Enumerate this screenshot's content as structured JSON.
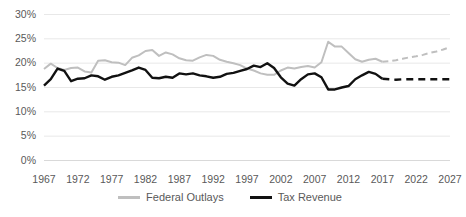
{
  "chart_data": {
    "type": "line",
    "title": "",
    "xlabel": "",
    "ylabel": "",
    "xlim": [
      1967,
      2027
    ],
    "ylim": [
      0,
      30
    ],
    "grid": true,
    "legend_position": "bottom",
    "y_ticks": [
      "0%",
      "5%",
      "10%",
      "15%",
      "20%",
      "25%",
      "30%"
    ],
    "y_tick_values": [
      0,
      5,
      10,
      15,
      20,
      25,
      30
    ],
    "x_ticks": [
      "1967",
      "1972",
      "1977",
      "1982",
      "1987",
      "1992",
      "1997",
      "2002",
      "2007",
      "2012",
      "2017",
      "2022",
      "2027"
    ],
    "x_tick_values": [
      1967,
      1972,
      1977,
      1982,
      1987,
      1992,
      1997,
      2002,
      2007,
      2012,
      2017,
      2022,
      2027
    ],
    "x": [
      1967,
      1968,
      1969,
      1970,
      1971,
      1972,
      1973,
      1974,
      1975,
      1976,
      1977,
      1978,
      1979,
      1980,
      1981,
      1982,
      1983,
      1984,
      1985,
      1986,
      1987,
      1988,
      1989,
      1990,
      1991,
      1992,
      1993,
      1994,
      1995,
      1996,
      1997,
      1998,
      1999,
      2000,
      2001,
      2002,
      2003,
      2004,
      2005,
      2006,
      2007,
      2008,
      2009,
      2010,
      2011,
      2012,
      2013,
      2014,
      2015,
      2016,
      2017,
      2018,
      2019,
      2020,
      2021,
      2022,
      2023,
      2024,
      2025,
      2026,
      2027
    ],
    "projection_start_year": 2017,
    "series": [
      {
        "name": "Federal Outlays",
        "color": "#bfbfbf",
        "values": [
          18.8,
          19.9,
          19.0,
          18.6,
          19.0,
          19.1,
          18.3,
          18.1,
          20.5,
          20.6,
          20.2,
          20.1,
          19.6,
          21.1,
          21.6,
          22.5,
          22.7,
          21.5,
          22.2,
          21.8,
          21.0,
          20.6,
          20.5,
          21.2,
          21.7,
          21.5,
          20.7,
          20.3,
          20.0,
          19.6,
          18.9,
          18.5,
          17.9,
          17.6,
          17.6,
          18.5,
          19.1,
          18.9,
          19.2,
          19.4,
          19.1,
          20.2,
          24.4,
          23.4,
          23.4,
          22.1,
          20.8,
          20.3,
          20.7,
          20.9,
          20.3,
          20.4,
          20.6,
          20.9,
          21.2,
          21.4,
          21.7,
          22.1,
          22.4,
          22.8,
          23.3
        ]
      },
      {
        "name": "Tax Revenue",
        "color": "#111111",
        "values": [
          15.4,
          16.7,
          18.9,
          18.4,
          16.3,
          16.8,
          16.9,
          17.5,
          17.3,
          16.6,
          17.2,
          17.5,
          18.0,
          18.5,
          19.1,
          18.6,
          17.0,
          16.9,
          17.2,
          17.0,
          17.9,
          17.7,
          17.9,
          17.5,
          17.3,
          17.0,
          17.2,
          17.8,
          18.0,
          18.4,
          18.8,
          19.5,
          19.2,
          20.0,
          19.0,
          17.1,
          15.8,
          15.4,
          16.7,
          17.7,
          17.9,
          17.1,
          14.6,
          14.6,
          15.0,
          15.3,
          16.7,
          17.5,
          18.2,
          17.8,
          16.8,
          16.7,
          16.6,
          16.7,
          16.7,
          16.7,
          16.7,
          16.7,
          16.7,
          16.7,
          16.7
        ]
      }
    ]
  },
  "legend": {
    "items": [
      {
        "label": "Federal Outlays"
      },
      {
        "label": "Tax Revenue"
      }
    ]
  }
}
